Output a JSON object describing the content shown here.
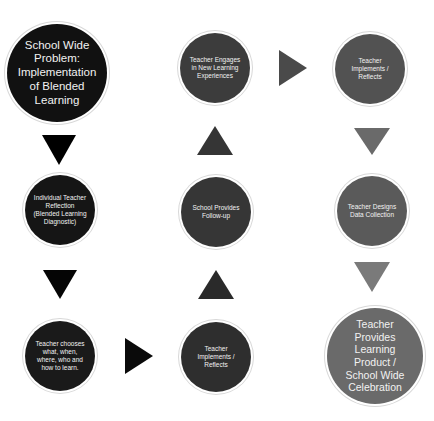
{
  "diagram": {
    "type": "flow",
    "nodes": [
      {
        "id": "n1",
        "label": "School Wide Problem: Implementation of Blended Learning",
        "color": "#111111"
      },
      {
        "id": "n2",
        "label": "Individual Teacher Reflection (Blended Learning Diagnostic)",
        "color": "#151515"
      },
      {
        "id": "n3",
        "label": "Teacher chooses what, when, where, who and how to learn.",
        "color": "#1a1a1a"
      },
      {
        "id": "n4",
        "label": "Teacher Implements / Reflects",
        "color": "#2e2e2e"
      },
      {
        "id": "n5",
        "label": "School Provides Follow-up",
        "color": "#363636"
      },
      {
        "id": "n6",
        "label": "Teacher Engages in New Learning Experiences",
        "color": "#3c3c3c"
      },
      {
        "id": "n7",
        "label": "Teacher Implements / Reflects",
        "color": "#525252"
      },
      {
        "id": "n8",
        "label": "Teacher Designs Data Collection",
        "color": "#5a5a5a"
      },
      {
        "id": "n9",
        "label": "Teacher Provides Learning Product / School Wide Celebration",
        "color": "#6a6a6a"
      }
    ],
    "edges": [
      {
        "from": "n1",
        "to": "n2",
        "direction": "down"
      },
      {
        "from": "n2",
        "to": "n3",
        "direction": "down"
      },
      {
        "from": "n3",
        "to": "n4",
        "direction": "right"
      },
      {
        "from": "n4",
        "to": "n5",
        "direction": "up"
      },
      {
        "from": "n5",
        "to": "n6",
        "direction": "up"
      },
      {
        "from": "n6",
        "to": "n7",
        "direction": "right"
      },
      {
        "from": "n7",
        "to": "n8",
        "direction": "down"
      },
      {
        "from": "n8",
        "to": "n9",
        "direction": "down"
      }
    ],
    "arrow_colors": {
      "a1": "#000000",
      "a2": "#050505",
      "a3": "#0a0a0a",
      "a4": "#2a2a2a",
      "a5": "#353535",
      "a6": "#4a4a4a",
      "a7": "#6a6a6a",
      "a8": "#7a7a7a"
    }
  }
}
